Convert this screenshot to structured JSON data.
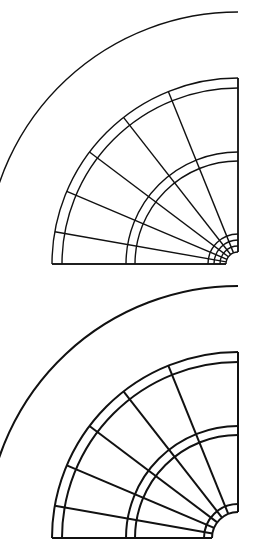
{
  "document": {
    "title": "Quarter-Circle Sector Technical Drawings",
    "background_color": "#ffffff",
    "line_color": "#111111",
    "width": 263,
    "height": 552
  },
  "figures": [
    {
      "id": "figure-top",
      "name": "upper-quarter-sector-drawing",
      "caption": "",
      "center": {
        "x": 238,
        "y": 264
      },
      "baseline_y": 264,
      "right_edge_x": 255,
      "quadrant": "upper-left",
      "outer_arc_radius": 252,
      "hub_radius": 12,
      "ring_radii": [
        12,
        18,
        24,
        30,
        103,
        112,
        176,
        186,
        252
      ],
      "ring_pairs": [
        {
          "inner": 103,
          "outer": 112
        },
        {
          "inner": 176,
          "outer": 186
        }
      ],
      "spoke_angles_deg": [
        90,
        112,
        128,
        143,
        157,
        170,
        180
      ],
      "line_width": 1.4,
      "outer_arc_open": true
    },
    {
      "id": "figure-bottom",
      "name": "lower-quarter-sector-drawing",
      "caption": "",
      "center": {
        "x": 238,
        "y": 260
      },
      "baseline_y": 260,
      "right_edge_x": 255,
      "quadrant": "upper-left",
      "outer_arc_radius": 252,
      "hub_radius": 26,
      "ring_radii": [
        26,
        34,
        103,
        112,
        176,
        186,
        252
      ],
      "ring_pairs": [
        {
          "inner": 103,
          "outer": 112
        },
        {
          "inner": 176,
          "outer": 186
        }
      ],
      "spoke_angles_deg": [
        90,
        112,
        128,
        143,
        157,
        170,
        180
      ],
      "line_width": 2.0,
      "outer_arc_open": true
    }
  ],
  "chart_data": {
    "type": "diagram",
    "panels": [
      {
        "label": "top",
        "arc_count": 9,
        "spoke_count": 7,
        "concentric_ring_pairs": 2,
        "hub_arcs": 4
      },
      {
        "label": "bottom",
        "arc_count": 7,
        "spoke_count": 7,
        "concentric_ring_pairs": 2,
        "hub_arcs": 2
      }
    ]
  }
}
